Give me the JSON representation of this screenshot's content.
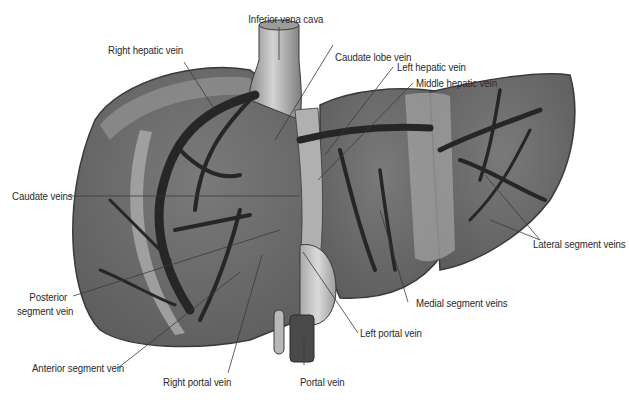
{
  "figure": {
    "colors": {
      "background": "#ffffff",
      "liver_tissue": "#6e6e6e",
      "liver_tissue_light": "#9a9a9a",
      "liver_edge": "#3a3a3a",
      "veins": "#262626",
      "vessel_light": "#b8b8b8",
      "leader_line": "#3a3a3a",
      "label_text": "#2a2a2a"
    }
  },
  "labels": {
    "inferior_vena_cava": "Inferior vena cava",
    "right_hepatic_vein": "Right hepatic vein",
    "caudate_lobe_vein": "Caudate lobe vein",
    "left_hepatic_vein": "Left hepatic vein",
    "middle_hepatic_vein": "Middle hepatic vein",
    "caudate_veins": "Caudate veins",
    "lateral_segment_veins": "Lateral segment veins",
    "posterior_segment_vein_line1": "Posterior",
    "posterior_segment_vein_line2": "segment vein",
    "medial_segment_veins": "Medial segment veins",
    "left_portal_vein": "Left portal vein",
    "anterior_segment_vein": "Anterior segment vein",
    "right_portal_vein": "Right portal vein",
    "portal_vein": "Portal vein"
  }
}
